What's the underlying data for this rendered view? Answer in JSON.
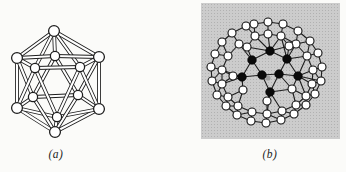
{
  "page": {
    "background": "#fbfbf9",
    "width": 346,
    "height": 172
  },
  "panel_a": {
    "label": "(a)",
    "kind": "ball-and-stick-icosahedron",
    "label_pos": {
      "x": 56,
      "y": 154
    },
    "nodes": [
      {
        "x": 54,
        "y": 31,
        "r": 5.4
      },
      {
        "x": 17,
        "y": 58,
        "r": 5.4
      },
      {
        "x": 99,
        "y": 57,
        "r": 5.4
      },
      {
        "x": 17,
        "y": 108,
        "r": 5.4
      },
      {
        "x": 99,
        "y": 109,
        "r": 5.4
      },
      {
        "x": 55,
        "y": 132,
        "r": 5.4
      },
      {
        "x": 55,
        "y": 56,
        "r": 4.6
      },
      {
        "x": 35,
        "y": 68,
        "r": 4.6
      },
      {
        "x": 80,
        "y": 67,
        "r": 4.6
      },
      {
        "x": 33,
        "y": 97,
        "r": 4.6
      },
      {
        "x": 78,
        "y": 95,
        "r": 4.6
      },
      {
        "x": 57,
        "y": 117,
        "r": 4.6
      }
    ],
    "edges": [
      [
        0,
        1
      ],
      [
        0,
        2
      ],
      [
        1,
        3
      ],
      [
        2,
        4
      ],
      [
        3,
        5
      ],
      [
        4,
        5
      ],
      [
        0,
        6
      ],
      [
        0,
        7
      ],
      [
        0,
        8
      ],
      [
        1,
        7
      ],
      [
        1,
        6
      ],
      [
        1,
        9
      ],
      [
        2,
        8
      ],
      [
        2,
        6
      ],
      [
        2,
        10
      ],
      [
        3,
        9
      ],
      [
        3,
        11
      ],
      [
        3,
        7
      ],
      [
        4,
        10
      ],
      [
        4,
        8
      ],
      [
        4,
        11
      ],
      [
        5,
        11
      ],
      [
        5,
        9
      ],
      [
        5,
        10
      ],
      [
        6,
        9
      ],
      [
        6,
        10
      ],
      [
        9,
        10
      ],
      [
        7,
        8
      ],
      [
        7,
        11
      ],
      [
        8,
        11
      ]
    ],
    "style": {
      "tube_outline": "#1c1c1c",
      "tube_fill": "#ffffff",
      "tube_outer_width": 3.8,
      "tube_inner_width": 2.1,
      "atom_fill": "#ffffff",
      "atom_stroke": "#1c1c1c",
      "atom_stroke_width": 1.25
    }
  },
  "panel_b": {
    "label": "(b)",
    "kind": "two-shell-icosahedral-cluster",
    "label_pos": {
      "x": 270,
      "y": 154
    },
    "panel_rect": {
      "x": 201,
      "y": 3,
      "w": 139,
      "h": 136
    },
    "panel_fill": "#cccccc",
    "panel_dot_color": "#b1b1b1",
    "white_atoms": [
      [
        268,
        22
      ],
      [
        283,
        24
      ],
      [
        298,
        31
      ],
      [
        310,
        41
      ],
      [
        318,
        53
      ],
      [
        322,
        67
      ],
      [
        321,
        81
      ],
      [
        315,
        94
      ],
      [
        306,
        105
      ],
      [
        294,
        114
      ],
      [
        281,
        120
      ],
      [
        266,
        123
      ],
      [
        251,
        121
      ],
      [
        237,
        115
      ],
      [
        226,
        106
      ],
      [
        217,
        95
      ],
      [
        212,
        81
      ],
      [
        211,
        67
      ],
      [
        215,
        54
      ],
      [
        222,
        42
      ],
      [
        232,
        33
      ],
      [
        246,
        26
      ],
      [
        254,
        24
      ],
      [
        268,
        34
      ],
      [
        255,
        36
      ],
      [
        281,
        36
      ],
      [
        239,
        44
      ],
      [
        296,
        44
      ],
      [
        228,
        56
      ],
      [
        307,
        56
      ],
      [
        222,
        70
      ],
      [
        313,
        70
      ],
      [
        222,
        84
      ],
      [
        312,
        84
      ],
      [
        228,
        97
      ],
      [
        306,
        96
      ],
      [
        238,
        106
      ],
      [
        296,
        105
      ],
      [
        252,
        112
      ],
      [
        282,
        111
      ],
      [
        267,
        114
      ],
      [
        247,
        47
      ],
      [
        289,
        46
      ],
      [
        233,
        76
      ],
      [
        243,
        90
      ],
      [
        292,
        89
      ],
      [
        267,
        101
      ]
    ],
    "black_atoms": [
      [
        270,
        51
      ],
      [
        252,
        60
      ],
      [
        287,
        59
      ],
      [
        242,
        77
      ],
      [
        298,
        76
      ],
      [
        262,
        75
      ],
      [
        279,
        74
      ],
      [
        270,
        92
      ]
    ],
    "center_atom": {
      "x": 268,
      "y": 78,
      "r": 2.6,
      "fill": "#9e9e9e"
    },
    "bond_rules": {
      "white_white": 17,
      "black_black": 23,
      "black_white": 24
    },
    "style": {
      "bond_color": "#1e1e1e",
      "bond_width": 1.1,
      "white_r": 4.0,
      "white_fill": "#ffffff",
      "white_stroke": "#111111",
      "white_stroke_width": 1.1,
      "black_r": 4.3,
      "black_fill": "#0a0a0a"
    }
  }
}
